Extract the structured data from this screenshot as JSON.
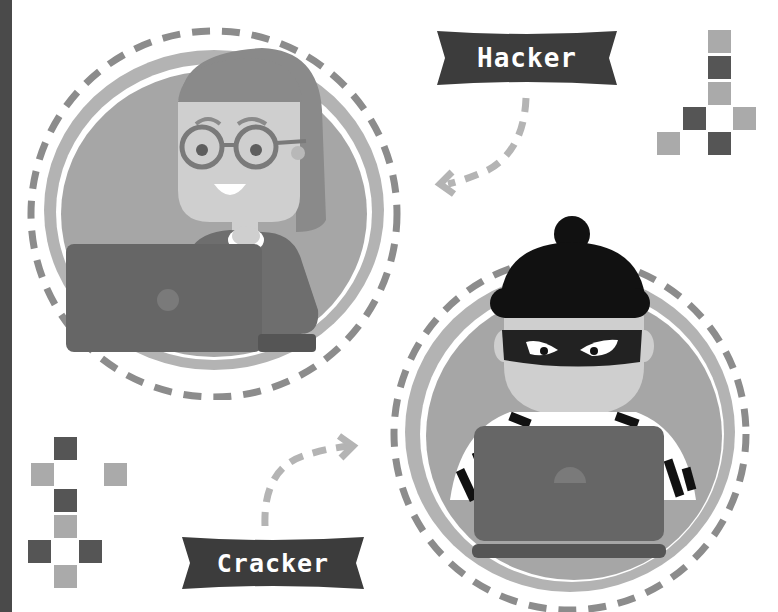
{
  "labels": {
    "hacker": "Hacker",
    "cracker": "Cracker"
  },
  "colors": {
    "background": "#ffffff",
    "side_strip": "#4a4a4a",
    "banner": "#3c3c3c",
    "banner_text": "#ffffff",
    "dash": "#8c8c8c",
    "arrow": "#b4b4b4",
    "circle_fill": "#a6a6a6",
    "circle_ring": "#b3b3b3",
    "square_light": "#aaaaaa",
    "square_dark": "#555555",
    "laptop": "#666666",
    "hat_mask": "#111111"
  },
  "decor": {
    "top_right_squares": [
      {
        "x": 708,
        "y": 30,
        "tone": "light"
      },
      {
        "x": 708,
        "y": 56,
        "tone": "dark"
      },
      {
        "x": 708,
        "y": 82,
        "tone": "light"
      },
      {
        "x": 683,
        "y": 107,
        "tone": "dark"
      },
      {
        "x": 733,
        "y": 107,
        "tone": "light"
      },
      {
        "x": 657,
        "y": 132,
        "tone": "light"
      },
      {
        "x": 708,
        "y": 132,
        "tone": "dark"
      }
    ],
    "bottom_left_squares": [
      {
        "x": 54,
        "y": 437,
        "tone": "dark"
      },
      {
        "x": 31,
        "y": 463,
        "tone": "light"
      },
      {
        "x": 104,
        "y": 463,
        "tone": "light"
      },
      {
        "x": 54,
        "y": 489,
        "tone": "dark"
      },
      {
        "x": 54,
        "y": 515,
        "tone": "light"
      },
      {
        "x": 28,
        "y": 540,
        "tone": "dark"
      },
      {
        "x": 79,
        "y": 540,
        "tone": "dark"
      },
      {
        "x": 54,
        "y": 565,
        "tone": "light"
      }
    ]
  },
  "illustrations": {
    "hacker": "woman-with-glasses-at-laptop",
    "cracker": "masked-burglar-at-laptop"
  }
}
